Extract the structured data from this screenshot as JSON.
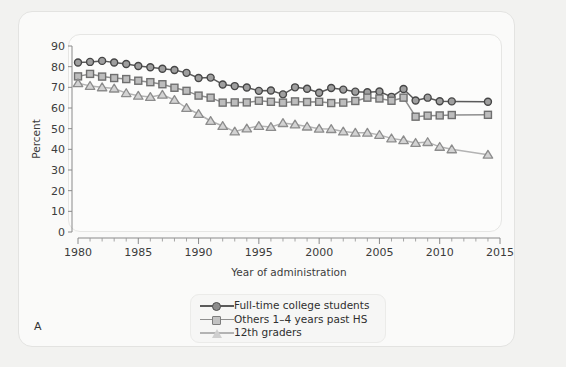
{
  "figure": {
    "panel_letter": "A"
  },
  "chart_data": {
    "type": "line",
    "title": "",
    "xlabel": "Year of administration",
    "ylabel": "Percent",
    "xlim": [
      1980,
      2015
    ],
    "ylim": [
      0,
      90
    ],
    "ytick_step": 10,
    "yticks": [
      0,
      10,
      20,
      30,
      40,
      50,
      60,
      70,
      80,
      90
    ],
    "xticks": [
      1980,
      1985,
      1990,
      1995,
      2000,
      2005,
      2010,
      2015
    ],
    "x_minor_tick_step": 1,
    "grid": false,
    "legend_position": "below-plot-center",
    "colors": {
      "full_time_college": "#5a5a5a",
      "others_past_hs": "#8e8e8e",
      "twelfth_graders": "#b3b3b3",
      "panel_background": "#fcfcfb",
      "figure_background": "#fafaf9"
    },
    "series": [
      {
        "name": "Full-time college students",
        "marker": "circle",
        "color": "#5a5a5a",
        "x": [
          1980,
          1981,
          1982,
          1983,
          1984,
          1985,
          1986,
          1987,
          1988,
          1989,
          1990,
          1991,
          1992,
          1993,
          1994,
          1995,
          1996,
          1997,
          1998,
          1999,
          2000,
          2001,
          2002,
          2003,
          2004,
          2005,
          2006,
          2007,
          2008,
          2009,
          2010,
          2011,
          2014
        ],
        "y": [
          82.0,
          82.3,
          82.8,
          82.0,
          81.3,
          80.3,
          79.7,
          79.0,
          78.4,
          77.0,
          74.5,
          74.7,
          71.4,
          70.6,
          69.9,
          68.3,
          68.5,
          66.6,
          70.0,
          69.3,
          67.4,
          69.7,
          68.9,
          67.9,
          67.6,
          68.0,
          65.4,
          69.2,
          63.6,
          65.0,
          63.3,
          63.2,
          63.0
        ]
      },
      {
        "name": "Others 1–4 years past HS",
        "marker": "square",
        "color": "#8e8e8e",
        "x": [
          1980,
          1981,
          1982,
          1983,
          1984,
          1985,
          1986,
          1987,
          1988,
          1989,
          1990,
          1991,
          1992,
          1993,
          1994,
          1995,
          1996,
          1997,
          1998,
          1999,
          2000,
          2001,
          2002,
          2003,
          2004,
          2005,
          2006,
          2007,
          2008,
          2009,
          2010,
          2011,
          2014
        ],
        "y": [
          75.3,
          76.5,
          75.2,
          74.5,
          74.0,
          73.2,
          72.5,
          71.5,
          69.8,
          68.3,
          66.0,
          65.0,
          62.6,
          62.7,
          62.7,
          63.5,
          63.0,
          62.6,
          63.2,
          62.9,
          63.0,
          62.4,
          62.6,
          63.4,
          65.0,
          64.6,
          63.5,
          65.0,
          55.8,
          56.3,
          56.4,
          56.6,
          56.7
        ]
      },
      {
        "name": "12th graders",
        "marker": "triangle",
        "color": "#b3b3b3",
        "x": [
          1980,
          1981,
          1982,
          1983,
          1984,
          1985,
          1986,
          1987,
          1988,
          1989,
          1990,
          1991,
          1992,
          1993,
          1994,
          1995,
          1996,
          1997,
          1998,
          1999,
          2000,
          2001,
          2002,
          2003,
          2004,
          2005,
          2006,
          2007,
          2008,
          2009,
          2010,
          2011,
          2014
        ],
        "y": [
          72.0,
          70.7,
          70.0,
          69.4,
          67.2,
          65.9,
          65.3,
          66.4,
          63.9,
          60.0,
          57.1,
          53.7,
          51.3,
          48.6,
          50.1,
          51.3,
          50.8,
          52.7,
          52.0,
          51.0,
          50.0,
          49.8,
          48.6,
          48.0,
          48.0,
          47.0,
          45.3,
          44.4,
          43.1,
          43.5,
          41.2,
          40.0,
          37.4
        ]
      }
    ],
    "notes": {
      "gap_after_2011": "line segment drawn from 2011 directly to 2014 (no data 2012–2013)"
    }
  },
  "legend": {
    "items": [
      {
        "label": "Full-time college students",
        "marker": "circle",
        "color": "#5a5a5a"
      },
      {
        "label": "Others 1–4 years past HS",
        "marker": "square",
        "color": "#8e8e8e"
      },
      {
        "label": "12th graders",
        "marker": "triangle",
        "color": "#b3b3b3"
      }
    ]
  }
}
